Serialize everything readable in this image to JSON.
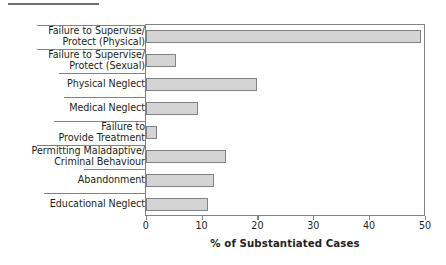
{
  "figure": {
    "caption_rule": "horizontal-rule"
  },
  "chart_data": {
    "type": "bar",
    "orientation": "horizontal",
    "title": "",
    "subtitle": "",
    "xlabel": "% of Substantiated Cases",
    "ylabel": "",
    "xlim": [
      0,
      50
    ],
    "xticks": [
      0,
      10,
      20,
      30,
      40,
      50
    ],
    "xtick_labels": [
      "0",
      "10",
      "20",
      "30",
      "40",
      "50"
    ],
    "grid": false,
    "legend": false,
    "bar_fill_color": "#d4d4d4",
    "bar_edge_color": "#808285",
    "categories": [
      "Failure to Supervise/ Protect (Physical)",
      "Failure to Supervise/ Protect (Sexual)",
      "Physical Neglect",
      "Medical Neglect",
      "Failure to Provide Treatment",
      "Permitting Maladaptive/ Criminal Behaviour",
      "Abandonment",
      "Educational Neglect"
    ],
    "values": [
      49.2,
      5.5,
      19.9,
      9.4,
      2.0,
      14.4,
      12.3,
      11.1
    ],
    "bars": [
      {
        "label_line1": "Failure to Supervise/",
        "label_line2": "Protect (Physical)",
        "value": 49.2
      },
      {
        "label_line1": "Failure to Supervise/",
        "label_line2": "Protect (Sexual)",
        "value": 5.5
      },
      {
        "label_line1": "Physical Neglect",
        "label_line2": "",
        "value": 19.9
      },
      {
        "label_line1": "Medical Neglect",
        "label_line2": "",
        "value": 9.4
      },
      {
        "label_line1": "Failure to",
        "label_line2": "Provide Treatment",
        "value": 2.0
      },
      {
        "label_line1": "Permitting Maladaptive/",
        "label_line2": "Criminal Behaviour",
        "value": 14.4
      },
      {
        "label_line1": "Abandonment",
        "label_line2": "",
        "value": 12.3
      },
      {
        "label_line1": "Educational Neglect",
        "label_line2": "",
        "value": 11.1
      }
    ]
  }
}
